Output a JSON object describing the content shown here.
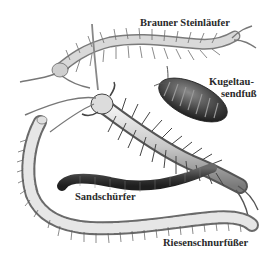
{
  "illustration": {
    "subject": "myriapods",
    "palette": {
      "background": "#ffffff",
      "ink": "#2a2a2a",
      "shade_dark": "#3b3b3b",
      "shade_mid": "#8a8a8a",
      "shade_light": "#d8d8d8"
    },
    "labels": [
      {
        "id": "brauner-steinlaeufer",
        "text": "Brauner Steinläufer"
      },
      {
        "id": "kugeltausendfuss",
        "text_line1": "Kugeltau-",
        "text_line2": "sendfuß"
      },
      {
        "id": "sandschuerfer",
        "text": "Sandschürfer"
      },
      {
        "id": "riesenschnurfuesser",
        "text": "Riesenschnurfüßer"
      }
    ]
  }
}
